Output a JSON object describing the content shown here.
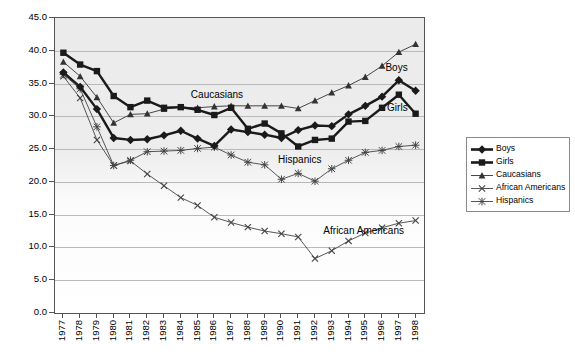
{
  "chart_data": {
    "type": "line",
    "title": "",
    "xlabel": "",
    "ylabel": "",
    "ylim": [
      0.0,
      45.0
    ],
    "yticks": [
      "0.0",
      "5.0",
      "10.0",
      "15.0",
      "20.0",
      "25.0",
      "30.0",
      "35.0",
      "40.0",
      "45.0"
    ],
    "grid": true,
    "legend_position": "right",
    "categories": [
      "1977",
      "1978",
      "1979",
      "1980",
      "1981",
      "1982",
      "1983",
      "1984",
      "1985",
      "1986",
      "1987",
      "1988",
      "1989",
      "1990",
      "1991",
      "1992",
      "1993",
      "1994",
      "1995",
      "1996",
      "1997",
      "1998"
    ],
    "series": [
      {
        "name": "Boys",
        "marker": "diamond",
        "values": [
          36.7,
          34.5,
          31.1,
          26.7,
          26.4,
          26.5,
          27.1,
          27.8,
          26.6,
          25.5,
          28.0,
          27.6,
          27.2,
          26.7,
          27.9,
          28.6,
          28.5,
          30.3,
          31.6,
          33.0,
          35.5,
          33.9
        ]
      },
      {
        "name": "Girls",
        "marker": "square",
        "values": [
          39.7,
          37.9,
          36.9,
          33.1,
          31.4,
          32.4,
          31.3,
          31.4,
          31.0,
          30.2,
          31.3,
          28.1,
          28.9,
          27.4,
          25.4,
          26.4,
          26.6,
          29.2,
          29.3,
          31.3,
          33.3,
          30.4
        ]
      },
      {
        "name": "Caucasians",
        "marker": "triangle",
        "values": [
          38.3,
          36.1,
          32.9,
          29.0,
          30.3,
          30.4,
          31.1,
          31.4,
          31.3,
          31.5,
          31.6,
          31.6,
          31.6,
          31.6,
          31.2,
          32.4,
          33.6,
          34.7,
          36.0,
          37.7,
          39.8,
          41.0
        ]
      },
      {
        "name": "African Americans",
        "marker": "x",
        "values": [
          36.1,
          32.8,
          26.4,
          22.5,
          23.2,
          21.2,
          19.4,
          17.6,
          16.4,
          14.6,
          13.8,
          13.1,
          12.5,
          12.1,
          11.6,
          8.3,
          9.5,
          11.0,
          12.2,
          13.0,
          13.7,
          14.1
        ]
      },
      {
        "name": "Hispanics",
        "marker": "star",
        "values": [
          36.4,
          34.2,
          28.4,
          22.5,
          23.3,
          24.6,
          24.7,
          24.8,
          25.1,
          25.3,
          24.1,
          23.0,
          22.6,
          20.4,
          21.3,
          20.1,
          22.0,
          23.3,
          24.5,
          24.8,
          25.4,
          25.6
        ]
      }
    ],
    "annotations": [
      {
        "text": "Caucasians",
        "x": 1984.6,
        "y": 33.3
      },
      {
        "text": "Boys",
        "x": 1996.2,
        "y": 37.3
      },
      {
        "text": "Girls",
        "x": 1996.3,
        "y": 31.2
      },
      {
        "text": "Hispanics",
        "x": 1989.8,
        "y": 23.4
      },
      {
        "text": "African Americans",
        "x": 1992.5,
        "y": 12.5
      }
    ]
  },
  "legend": {
    "items": [
      {
        "label": "Boys",
        "marker": "diamond",
        "color": "#1a1a1a",
        "weight": "thick"
      },
      {
        "label": "Girls",
        "marker": "square",
        "color": "#1a1a1a",
        "weight": "thick"
      },
      {
        "label": "Caucasians",
        "marker": "triangle",
        "color": "#333333",
        "weight": "thin"
      },
      {
        "label": "African Americans",
        "marker": "x",
        "color": "#444444",
        "weight": "thin"
      },
      {
        "label": "Hispanics",
        "marker": "star",
        "color": "#444444",
        "weight": "thin"
      }
    ]
  },
  "colors": {
    "plot_background_top": "#ebebeb",
    "plot_background_bottom": "#ffffff",
    "gridline": "#b9b9b9",
    "axis": "#555555",
    "series_dark": "#1a1a1a",
    "series_light": "#444444"
  }
}
